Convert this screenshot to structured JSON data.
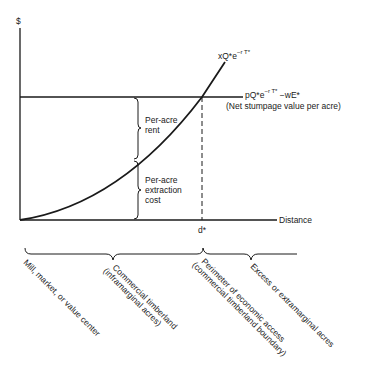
{
  "diagram": {
    "y_axis_label": "$",
    "x_axis_label": "Distance",
    "curve": {
      "label_base": "xQ*e",
      "label_exp": "−r T*"
    },
    "line": {
      "label_base": "pQ*e",
      "label_exp": "−r T*",
      "label_tail": " −wE*",
      "caption": "(Net stumpage value per acre)"
    },
    "critical_distance": "d*",
    "inner_braces": [
      {
        "line1": "Per-acre",
        "line2": "rent",
        "line3": ""
      },
      {
        "line1": "Per-acre",
        "line2": "extraction",
        "line3": "cost"
      }
    ],
    "regions": [
      {
        "line1": "Mill, market, or value center",
        "line2": ""
      },
      {
        "line1": "Commercial timberland",
        "line2": "(inframarginal acres)"
      },
      {
        "line1": "Perimeter of economic access",
        "line2": "(commercial timberland boundary)"
      },
      {
        "line1": "Excess or extramarginal acres",
        "line2": ""
      }
    ],
    "colors": {
      "ink": "#1a1a1a",
      "background": "#ffffff"
    }
  }
}
